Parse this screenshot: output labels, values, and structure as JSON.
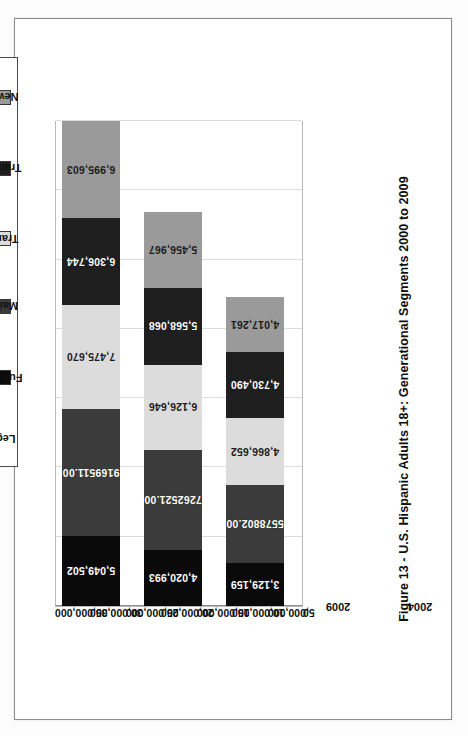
{
  "page": {
    "caption": "Figure 13 - U.S. Hispanic Adults 18+: Generational Segments 2000 to 2009"
  },
  "legend": {
    "title": "Legend",
    "items": [
      {
        "label": "Full Adapters",
        "color": "#0a0a0a"
      },
      {
        "label": "Maintainers",
        "color": "#3b3b3b"
      },
      {
        "label": "Transplants",
        "color": "#dcdcdc"
      },
      {
        "label": "Transitionals",
        "color": "#1f1f1f"
      },
      {
        "label": "Newcomers",
        "color": "#9a9a9a"
      }
    ]
  },
  "axis": {
    "value_ticks": [
      "35,000,000",
      "30,000,000",
      "25,000,000",
      "20,000,000",
      "15,000,000",
      "10,000,000",
      "5,000,000",
      "0"
    ],
    "category_labels": [
      "2009",
      "2004",
      "2000"
    ]
  },
  "chart_data": {
    "type": "bar",
    "orientation": "horizontal-stacked",
    "title": "Figure 13 - U.S. Hispanic Adults 18+: Generational Segments 2000 to 2009",
    "xlabel": "",
    "ylabel": "",
    "ylim": [
      0,
      35000000
    ],
    "grid": true,
    "legend_position": "top-center",
    "categories": [
      "2009",
      "2004",
      "2000"
    ],
    "series": [
      {
        "name": "Full Adapters",
        "color": "#0a0a0a",
        "values": [
          5049502,
          4020993,
          3129159
        ],
        "labels": [
          "5,049,502",
          "4,020,993",
          "3,129,159"
        ]
      },
      {
        "name": "Maintainers",
        "color": "#3b3b3b",
        "values": [
          9169511,
          7262521,
          5578802
        ],
        "labels": [
          "9169511.00",
          "7262521.00",
          "5578802.00"
        ]
      },
      {
        "name": "Transplants",
        "color": "#dcdcdc",
        "values": [
          7475670,
          6126646,
          4866652
        ],
        "labels": [
          "7,475,670",
          "6,126,646",
          "4,866,652"
        ]
      },
      {
        "name": "Transitionals",
        "color": "#1f1f1f",
        "values": [
          6306744,
          5568068,
          4730490
        ],
        "labels": [
          "6,306,744",
          "5,568,068",
          "4,730,490"
        ]
      },
      {
        "name": "Newcomers",
        "color": "#9a9a9a",
        "values": [
          6995603,
          5456967,
          4017261
        ],
        "labels": [
          "6,995,603",
          "5,456,967",
          "4,017,261"
        ]
      }
    ],
    "totals": [
      35007030,
      28435195,
      22322364
    ]
  }
}
